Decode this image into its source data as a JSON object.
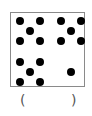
{
  "figure": {
    "box_border_color": "#8a8a8a",
    "dot_color": "#000000",
    "groups": [
      {
        "name": "top-left",
        "count": 5
      },
      {
        "name": "top-right",
        "count": 5
      },
      {
        "name": "bottom-left",
        "count": 5
      },
      {
        "name": "bottom-right",
        "count": 1
      }
    ],
    "total_dots": 16
  },
  "answer": {
    "open_paren": "(",
    "close_paren": ")",
    "value": ""
  }
}
